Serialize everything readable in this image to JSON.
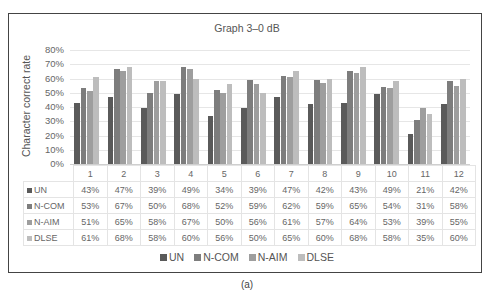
{
  "figure_label": "(a)",
  "chart_data": {
    "type": "bar",
    "title": "Graph 3–0 dB",
    "xlabel": "",
    "ylabel": "Character correct rate",
    "ylim": [
      0,
      80
    ],
    "yticks": [
      "80%",
      "70%",
      "60%",
      "50%",
      "40%",
      "30%",
      "20%",
      "10%",
      "0%"
    ],
    "grid": true,
    "legend_position": "bottom",
    "categories": [
      "1",
      "2",
      "3",
      "4",
      "5",
      "6",
      "7",
      "8",
      "9",
      "10",
      "11",
      "12"
    ],
    "series": [
      {
        "name": "UN",
        "color": "#5a5a5a",
        "values": [
          43,
          47,
          39,
          49,
          34,
          39,
          47,
          42,
          43,
          49,
          21,
          42
        ]
      },
      {
        "name": "N-COM",
        "color": "#7d7d7d",
        "values": [
          53,
          67,
          50,
          68,
          52,
          59,
          62,
          59,
          65,
          54,
          31,
          58
        ]
      },
      {
        "name": "N-AIM",
        "color": "#9e9e9e",
        "values": [
          51,
          65,
          58,
          67,
          50,
          56,
          61,
          57,
          64,
          53,
          39,
          55
        ]
      },
      {
        "name": "DLSE",
        "color": "#bdbdbd",
        "values": [
          61,
          68,
          58,
          60,
          56,
          50,
          65,
          60,
          68,
          58,
          35,
          60
        ]
      }
    ],
    "data_table": true
  }
}
